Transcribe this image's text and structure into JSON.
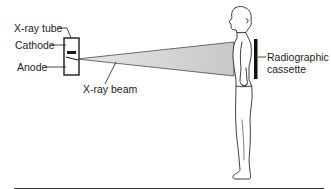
{
  "diagram": {
    "labels": {
      "xray_tube": "X-ray tube",
      "cathode": "Cathode",
      "anode": "Anode",
      "xray_beam": "X-ray beam",
      "cassette_line1": "Radiographic",
      "cassette_line2": "cassette"
    },
    "colors": {
      "line": "#1a1a1a",
      "beam": "#d4d4d4",
      "background": "#ffffff"
    }
  }
}
